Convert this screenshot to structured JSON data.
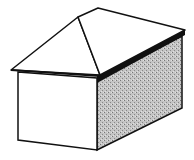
{
  "diagram": {
    "colors": {
      "background": "#ffffff",
      "line": "#111111",
      "shaded_wall": "#b8b8b8",
      "fascia": "#111111"
    }
  }
}
